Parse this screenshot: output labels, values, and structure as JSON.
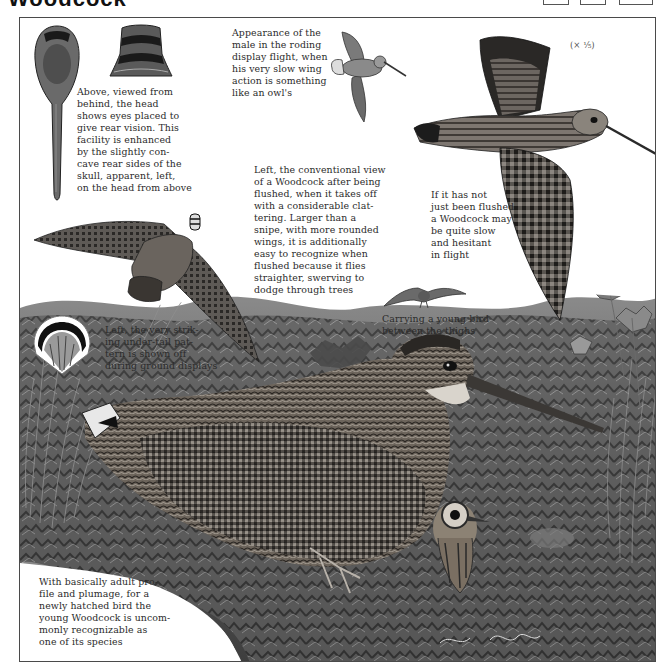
{
  "page": {
    "title": "Woodcock",
    "header_boxes": 3,
    "scale_note": "(× ¹⁄₅)"
  },
  "captions": {
    "head_rear": "Above, viewed from\nbehind, the head\nshows eyes placed to\ngive rear vision. This\nfacility is enhanced\nby the slightly con-\ncave rear sides of the\nskull, apparent, left,\non the head from above",
    "roding": "Appearance of the\nmale in the roding\ndisplay flight, when\nhis very slow wing\naction is something\nlike an owl's",
    "flushed": "Left, the conventional view\nof a Woodcock after being\nflushed, when it takes off\nwith a considerable clat-\ntering. Larger than a\nsnipe, with more rounded\nwings, it is additionally\neasy to recognize when\nflushed because it flies\nstraighter, swerving to\ndodge through trees",
    "slow_flight": "If it has not\njust been flushed\na Woodcock may\nbe quite slow\nand hesitant\nin flight",
    "carrying": "Carrying a young bird\nbetween the thighs",
    "under_tail": "Left, the very strik-\ning under-tail pat-\ntern is shown off\nduring ground displays",
    "young": "With basically adult pro-\nfile and plumage, for a\nnewly hatched bird the\nyoung Woodcock is uncom-\nmonly recognizable as\none of its species"
  },
  "illustrations": [
    {
      "name": "head-from-above",
      "icon": "woodcock-head-top-view"
    },
    {
      "name": "head-from-behind",
      "icon": "woodcock-head-rear-view"
    },
    {
      "name": "roding-flight",
      "icon": "woodcock-roding"
    },
    {
      "name": "large-flight",
      "icon": "woodcock-slow-flight"
    },
    {
      "name": "flushed-flight",
      "icon": "woodcock-flushed"
    },
    {
      "name": "carrying-young",
      "icon": "woodcock-carrying-chick"
    },
    {
      "name": "under-tail-fan",
      "icon": "woodcock-tail-fan"
    },
    {
      "name": "sitting-adult-with-chick",
      "icon": "woodcock-ground-scene"
    }
  ],
  "colors": {
    "paper": "#ffffff",
    "ink": "#2b2b2b",
    "frame": "#4a4a4a",
    "foliage_dark": "#3a3a3a",
    "foliage_mid": "#7a7a7a",
    "foliage_light": "#b5b5b5"
  }
}
